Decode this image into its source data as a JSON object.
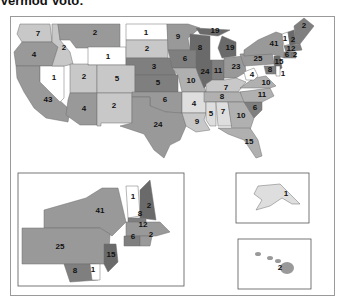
{
  "title": "Vermod Voto:",
  "legend_note": "Electoral votes by state (shaded)",
  "colors": {
    "c1": "#ffffff",
    "c2": "#dedede",
    "c3": "#c8c8c8",
    "c4": "#b0b0b0",
    "c5": "#999999",
    "c6": "#7f7f7f",
    "c7": "#6a6a6a",
    "c8": "#575757"
  },
  "states": [
    {
      "id": "WA",
      "value": "7",
      "shade": "c3"
    },
    {
      "id": "OR",
      "value": "4",
      "shade": "c5"
    },
    {
      "id": "CA",
      "value": "43",
      "shade": "c5"
    },
    {
      "id": "NV",
      "value": "1",
      "shade": "c1"
    },
    {
      "id": "ID",
      "value": "2",
      "shade": "c3"
    },
    {
      "id": "MT",
      "value": "2",
      "shade": "c5"
    },
    {
      "id": "WY",
      "value": "1",
      "shade": "c1"
    },
    {
      "id": "UT",
      "value": "2",
      "shade": "c3"
    },
    {
      "id": "AZ",
      "value": "4",
      "shade": "c5"
    },
    {
      "id": "CO",
      "value": "5",
      "shade": "c3"
    },
    {
      "id": "NM",
      "value": "2",
      "shade": "c3"
    },
    {
      "id": "ND",
      "value": "1",
      "shade": "c1"
    },
    {
      "id": "SD",
      "value": "2",
      "shade": "c3"
    },
    {
      "id": "NE",
      "value": "3",
      "shade": "c6"
    },
    {
      "id": "KS",
      "value": "5",
      "shade": "c6"
    },
    {
      "id": "OK",
      "value": "6",
      "shade": "c5"
    },
    {
      "id": "TX",
      "value": "24",
      "shade": "c5"
    },
    {
      "id": "MN",
      "value": "9",
      "shade": "c5"
    },
    {
      "id": "IA",
      "value": "6",
      "shade": "c6"
    },
    {
      "id": "MO",
      "value": "10",
      "shade": "c4"
    },
    {
      "id": "AR",
      "value": "4",
      "shade": "c2"
    },
    {
      "id": "LA",
      "value": "9",
      "shade": "c3"
    },
    {
      "id": "WI",
      "value": "8",
      "shade": "c7"
    },
    {
      "id": "IL",
      "value": "24",
      "shade": "c7"
    },
    {
      "id": "MI-UP",
      "value": "19",
      "shade": "c7"
    },
    {
      "id": "MI",
      "value": "19",
      "shade": "c7"
    },
    {
      "id": "IN",
      "value": "11",
      "shade": "c6"
    },
    {
      "id": "OH",
      "value": "23",
      "shade": "c5"
    },
    {
      "id": "KY",
      "value": "7",
      "shade": "c3"
    },
    {
      "id": "TN",
      "value": "8",
      "shade": "c4"
    },
    {
      "id": "MS",
      "value": "5",
      "shade": "c2"
    },
    {
      "id": "AL",
      "value": "7",
      "shade": "c2"
    },
    {
      "id": "GA",
      "value": "10",
      "shade": "c4"
    },
    {
      "id": "FL",
      "value": "15",
      "shade": "c4"
    },
    {
      "id": "SC",
      "value": "6",
      "shade": "c6"
    },
    {
      "id": "NC",
      "value": "11",
      "shade": "c4"
    },
    {
      "id": "VA",
      "value": "10",
      "shade": "c4"
    },
    {
      "id": "WV",
      "value": "4",
      "shade": "c1"
    },
    {
      "id": "PA",
      "value": "25",
      "shade": "c5"
    },
    {
      "id": "NY",
      "value": "41",
      "shade": "c5"
    },
    {
      "id": "VT",
      "value": "1",
      "shade": "c1"
    },
    {
      "id": "NH",
      "value": "2",
      "shade": "c7"
    },
    {
      "id": "ME",
      "value": "2",
      "shade": "c6"
    },
    {
      "id": "MA",
      "value": "12",
      "shade": "c6"
    },
    {
      "id": "CT",
      "value": "6",
      "shade": "c6"
    },
    {
      "id": "RI",
      "value": "2",
      "shade": "c6"
    },
    {
      "id": "NJ",
      "value": "15",
      "shade": "c7"
    },
    {
      "id": "MD",
      "value": "8",
      "shade": "c6"
    },
    {
      "id": "DE",
      "value": "1",
      "shade": "c1"
    },
    {
      "id": "AK",
      "value": "1",
      "shade": "c2"
    },
    {
      "id": "HI",
      "value": "2",
      "shade": "c5"
    }
  ],
  "northeast_inset": {
    "labels": [
      {
        "id": "NY",
        "value": "41"
      },
      {
        "id": "VT",
        "value": "1"
      },
      {
        "id": "NH",
        "value": "2"
      },
      {
        "id": "MA-N",
        "value": "8"
      },
      {
        "id": "MA",
        "value": "12"
      },
      {
        "id": "CT",
        "value": "6"
      },
      {
        "id": "RI",
        "value": "2"
      },
      {
        "id": "PA",
        "value": "25"
      },
      {
        "id": "NJ",
        "value": "15"
      },
      {
        "id": "MD",
        "value": "8"
      },
      {
        "id": "DE",
        "value": "1"
      }
    ]
  },
  "alaska_inset": {
    "value": "1"
  },
  "hawaii_inset": {
    "value": "2"
  }
}
